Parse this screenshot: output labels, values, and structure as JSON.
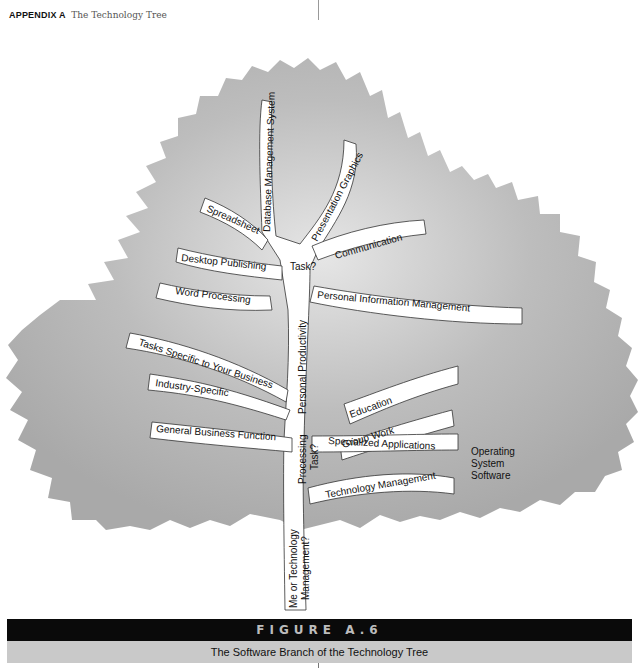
{
  "header": {
    "section": "APPENDIX A",
    "title": "The Technology Tree"
  },
  "diagram": {
    "canopy_color": "#b5b5b5",
    "branch_color": "#ffffff",
    "trunk_labels": {
      "root_question": "Me or Technology Management?",
      "processing_question": "Processing Task?",
      "personal_productivity": "Personal Productivity",
      "task_question": "Task?"
    },
    "top_branches": [
      "Database Management System",
      "Presentation Graphics",
      "Spreadsheet",
      "Communication",
      "Desktop Publishing",
      "Word Processing",
      "Personal Information Management"
    ],
    "middle_branches": [
      "Tasks Specific to Your Business",
      "Education",
      "Industry-Specific",
      "Group Work",
      "General Business Function",
      "Specialized Applications"
    ],
    "lower_branches": [
      "Technology Management"
    ],
    "side_note": [
      "Operating",
      "System",
      "Software"
    ]
  },
  "figure": {
    "label": "FIGURE A.6",
    "caption": "The Software Branch of the Technology Tree"
  }
}
